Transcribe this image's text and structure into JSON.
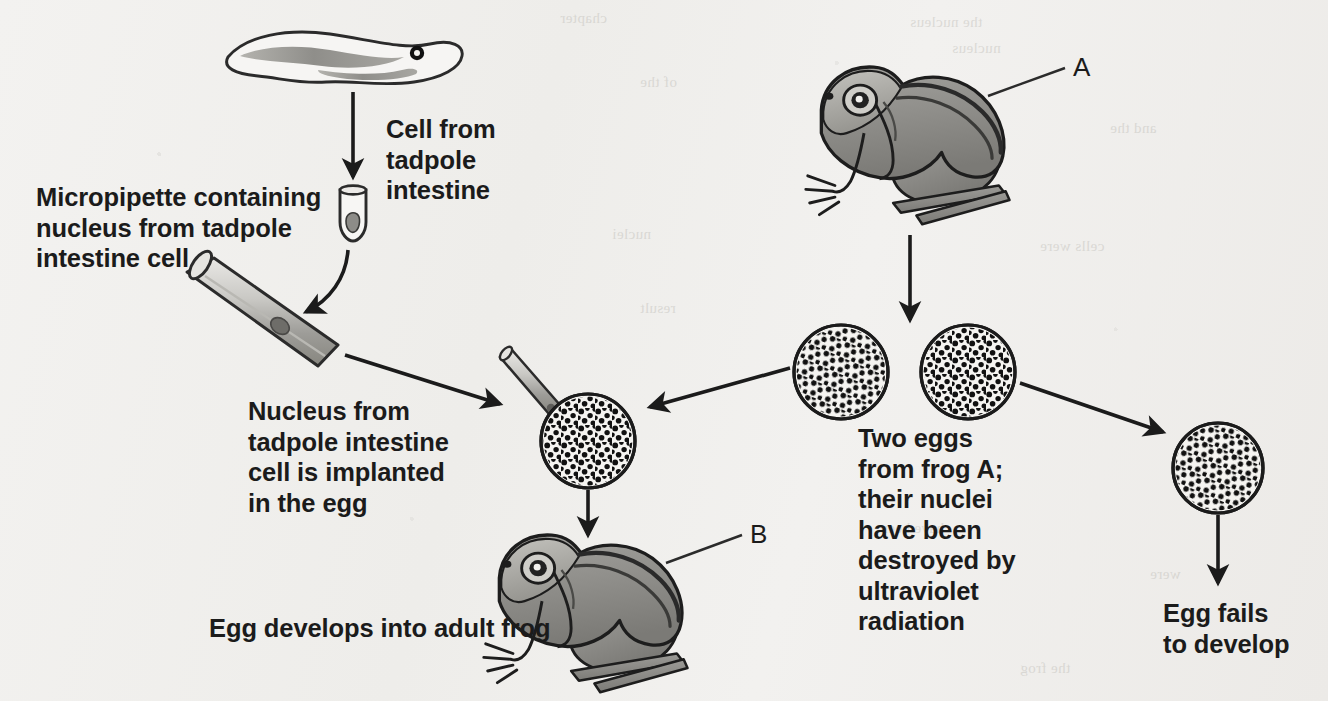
{
  "figure": {
    "background_color": "#f1f0ee",
    "ink_color": "#1b1b1b",
    "organism_fill": "#8e8d8a"
  },
  "labels": {
    "cell_from_tadpole": "Cell from\ntadpole\nintestine",
    "micropipette": "Micropipette containing\nnucleus from tadpole\nintestine cell",
    "nucleus_implanted": "Nucleus from\ntadpole intestine\ncell is implanted\nin the egg",
    "two_eggs": "Two eggs\nfrom frog A;\ntheir nuclei\nhave been\ndestroyed by\nultraviolet\nradiation",
    "egg_develops": "Egg develops into adult frog",
    "egg_fails": "Egg fails\nto develop",
    "frog_a_tag": "A",
    "frog_b_tag": "B"
  },
  "elements": {
    "tadpole": "tadpole",
    "test_tube": "test-tube",
    "micropipette": "micropipette",
    "frog_a": "adult-frog-a",
    "frog_b": "adult-frog-b",
    "egg_injected": "egg-with-implanted-nucleus",
    "egg_left": "enucleated-egg-left",
    "egg_right": "enucleated-egg-right",
    "egg_failed": "undeveloped-egg"
  },
  "arrows": [
    {
      "name": "tadpole-to-tube",
      "from": "tadpole",
      "to": "test-tube"
    },
    {
      "name": "tube-to-micropipette",
      "from": "test-tube",
      "to": "micropipette"
    },
    {
      "name": "micropipette-to-egg",
      "from": "micropipette",
      "to": "egg-with-implanted-nucleus"
    },
    {
      "name": "frog-a-to-eggs",
      "from": "adult-frog-a",
      "to": "eggs"
    },
    {
      "name": "left-egg-to-injected-egg",
      "from": "enucleated-egg-left",
      "to": "egg-with-implanted-nucleus"
    },
    {
      "name": "injected-egg-to-frog-b",
      "from": "egg-with-implanted-nucleus",
      "to": "adult-frog-b"
    },
    {
      "name": "right-egg-to-failed-egg",
      "from": "enucleated-egg-right",
      "to": "undeveloped-egg"
    },
    {
      "name": "failed-egg-to-caption",
      "from": "undeveloped-egg",
      "to": "egg-fails-label"
    }
  ],
  "bleed_through": [
    {
      "text": "the nucleus",
      "x": 910,
      "y": 14
    },
    {
      "text": "nucleus",
      "x": 952,
      "y": 40
    },
    {
      "text": "chapter",
      "x": 560,
      "y": 10
    },
    {
      "text": "of the",
      "x": 640,
      "y": 74
    },
    {
      "text": "and the",
      "x": 1110,
      "y": 120
    },
    {
      "text": "cells were",
      "x": 1040,
      "y": 238
    },
    {
      "text": "nuclei",
      "x": 612,
      "y": 226
    },
    {
      "text": "result",
      "x": 640,
      "y": 300
    },
    {
      "text": "have been",
      "x": 880,
      "y": 520
    },
    {
      "text": "were",
      "x": 1150,
      "y": 566
    },
    {
      "text": "the frog",
      "x": 1020,
      "y": 660
    }
  ]
}
